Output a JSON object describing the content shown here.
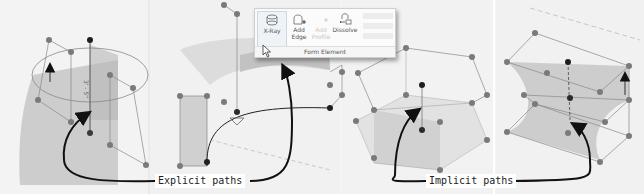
{
  "ribbon": {
    "buttons": [
      {
        "label": "X-Ray",
        "icon": "x-ray-icon",
        "state": "active"
      },
      {
        "label": "Add Edge",
        "icon": "add-edge-icon",
        "state": "enabled"
      },
      {
        "label": "Add Profile",
        "icon": "add-profile-icon",
        "state": "disabled"
      },
      {
        "label": "Dissolve",
        "icon": "dissolve-icon",
        "state": "enabled"
      }
    ],
    "add_edge_line1": "Add",
    "add_edge_line2": "Edge",
    "add_prof_line1": "Add",
    "add_prof_line2": "Profile",
    "panel_title": "Form Element"
  },
  "annotations": {
    "explicit": "Explicit paths",
    "implicit": "Implicit paths",
    "dimension_label": "3' - 5\""
  },
  "colors": {
    "surface": "#bdbdbd",
    "node": "#7a7a7a",
    "node_active": "#1e1e1e",
    "arrow": "#111111"
  }
}
